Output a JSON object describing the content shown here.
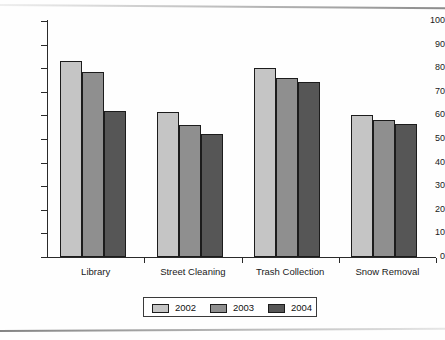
{
  "chart_data": {
    "type": "bar",
    "title": "",
    "xlabel": "",
    "ylabel": "",
    "ylim": [
      0,
      100
    ],
    "ytick_step": 10,
    "grid": false,
    "legend_position": "bottom-center",
    "categories": [
      "Library",
      "Street Cleaning",
      "Trash Collection",
      "Snow Removal"
    ],
    "series": [
      {
        "name": "2002",
        "color": "#c5c5c5",
        "values": [
          83,
          61.5,
          80,
          60
        ]
      },
      {
        "name": "2003",
        "color": "#8f8f8f",
        "values": [
          78.5,
          56,
          76,
          58
        ]
      },
      {
        "name": "2004",
        "color": "#565656",
        "values": [
          62,
          52,
          74,
          56.5
        ]
      }
    ],
    "ytick_labels": [
      "100",
      "90",
      "80",
      "70",
      "60",
      "50",
      "40",
      "30",
      "20",
      "10",
      "0"
    ],
    "ytick_values": [
      100,
      90,
      80,
      70,
      60,
      50,
      40,
      30,
      20,
      10,
      0
    ]
  },
  "legend": {
    "entries": [
      {
        "label": "2002",
        "color": "#c5c5c5"
      },
      {
        "label": "2003",
        "color": "#8f8f8f"
      },
      {
        "label": "2004",
        "color": "#565656"
      }
    ]
  },
  "axis": {
    "line_color": "#2a2a2a"
  }
}
